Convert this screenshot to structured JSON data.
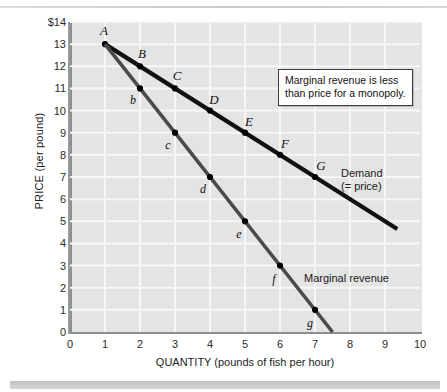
{
  "figure": {
    "y_axis_title": "PRICE (per pound)",
    "x_axis_title": "QUANTITY (pounds of fish per hour)",
    "callout_text": "Marginal revenue is less\nthan price for a monopoly.",
    "demand_label": "Demand\n(= price)",
    "marginal_revenue_label": "Marginal revenue"
  },
  "chart_data": {
    "type": "line",
    "title": "",
    "xlabel": "QUANTITY (pounds of fish per hour)",
    "ylabel": "PRICE (per pound)",
    "xlim": [
      0,
      10
    ],
    "ylim": [
      0,
      14
    ],
    "xticks": [
      "0",
      "1",
      "2",
      "3",
      "4",
      "5",
      "6",
      "7",
      "8",
      "9",
      "10"
    ],
    "yticks": [
      "0",
      "1",
      "2",
      "3",
      "4",
      "5",
      "6",
      "7",
      "8",
      "9",
      "10",
      "11",
      "12",
      "13",
      "$14"
    ],
    "grid": true,
    "legend_position": "inline-annotation",
    "series": [
      {
        "name": "Demand (= price)",
        "color": "#111111",
        "line_from": [
          1,
          13
        ],
        "line_to": [
          9.35,
          4.65
        ],
        "points": [
          {
            "label": "A",
            "x": 1,
            "y": 13
          },
          {
            "label": "B",
            "x": 2,
            "y": 12
          },
          {
            "label": "C",
            "x": 3,
            "y": 11
          },
          {
            "label": "D",
            "x": 4,
            "y": 10
          },
          {
            "label": "E",
            "x": 5,
            "y": 9
          },
          {
            "label": "F",
            "x": 6,
            "y": 8
          },
          {
            "label": "G",
            "x": 7,
            "y": 7
          }
        ]
      },
      {
        "name": "Marginal revenue",
        "color": "#4a4a4a",
        "line_from": [
          1,
          13
        ],
        "line_to": [
          7.5,
          0
        ],
        "points": [
          {
            "label": "A",
            "x": 1,
            "y": 13
          },
          {
            "label": "b",
            "x": 2,
            "y": 11
          },
          {
            "label": "c",
            "x": 3,
            "y": 9
          },
          {
            "label": "d",
            "x": 4,
            "y": 7
          },
          {
            "label": "e",
            "x": 5,
            "y": 5
          },
          {
            "label": "f",
            "x": 6,
            "y": 3
          },
          {
            "label": "g",
            "x": 7,
            "y": 1
          }
        ]
      }
    ],
    "annotations": [
      {
        "text": "Marginal revenue is less than price for a monopoly."
      }
    ]
  }
}
